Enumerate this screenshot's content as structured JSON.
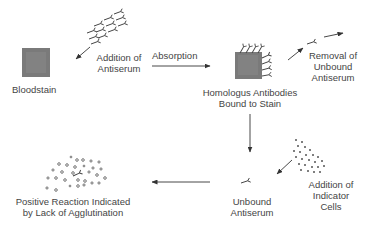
{
  "diagram": {
    "type": "process-flow",
    "colors": {
      "stain": "#7a7a7a",
      "ink": "#3a3a3a",
      "background": "#ffffff"
    },
    "nodes": [
      {
        "id": "bloodstain",
        "label": "Bloodstain"
      },
      {
        "id": "addition_antiserum",
        "label_line1": "Addition of",
        "label_line2": "Antiserum"
      },
      {
        "id": "absorption",
        "label": "Absorption"
      },
      {
        "id": "bound",
        "label_line1": "Homologus Antibodies",
        "label_line2": "Bound to Stain"
      },
      {
        "id": "removal",
        "label_line1": "Removal of",
        "label_line2": "Unbound",
        "label_line3": "Antiserum"
      },
      {
        "id": "indicator",
        "label_line1": "Addition of",
        "label_line2": "Indicator",
        "label_line3": "Cells"
      },
      {
        "id": "unbound",
        "label_line1": "Unbound",
        "label_line2": "Antiserum"
      },
      {
        "id": "positive",
        "label_line1": "Positive Reaction Indicated",
        "label_line2": "by Lack of Agglutination"
      }
    ],
    "edges": [
      {
        "from": "addition_antiserum",
        "to": "bloodstain"
      },
      {
        "from": "bloodstain",
        "to": "bound",
        "label": "Absorption"
      },
      {
        "from": "bound",
        "to": "removal"
      },
      {
        "from": "bound",
        "to": "unbound"
      },
      {
        "from": "indicator",
        "to": "unbound"
      },
      {
        "from": "unbound",
        "to": "positive"
      }
    ]
  }
}
